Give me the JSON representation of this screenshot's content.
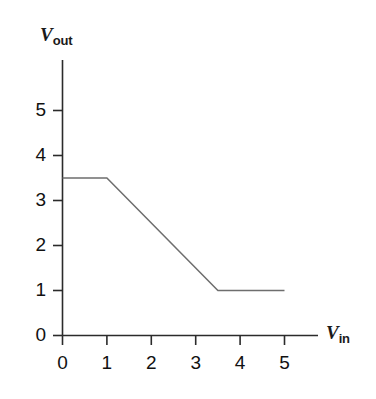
{
  "figure": {
    "name": "voltage-transfer-characteristic",
    "background_color": "#ffffff",
    "axis_color": "#2b2b2b",
    "curve_color": "#6e6e6e"
  },
  "axes": {
    "y": {
      "label_symbol": "V",
      "label_subscript": "out",
      "ticks": [
        "5",
        "4",
        "3",
        "2",
        "1",
        "0"
      ],
      "min": 0,
      "max": 5
    },
    "x": {
      "label_symbol": "V",
      "label_subscript": "in",
      "ticks": [
        "0",
        "1",
        "2",
        "3",
        "4",
        "5"
      ],
      "min": 0,
      "max": 5
    }
  },
  "chart_data": {
    "type": "line",
    "title": "",
    "subtitle": "",
    "xlabel": "Vin",
    "ylabel": "Vout",
    "xlim": [
      0,
      5
    ],
    "ylim": [
      0,
      5
    ],
    "xticks": [
      0,
      1,
      2,
      3,
      4,
      5
    ],
    "yticks": [
      0,
      1,
      2,
      3,
      4,
      5
    ],
    "grid": false,
    "legend": null,
    "legend_position": "none",
    "series": [
      {
        "name": "Vout vs Vin",
        "x": [
          0,
          1,
          3.5,
          5
        ],
        "values": [
          3.5,
          3.5,
          1,
          1
        ],
        "color": "#6e6e6e",
        "linewidth": 1
      }
    ],
    "annotations": []
  }
}
